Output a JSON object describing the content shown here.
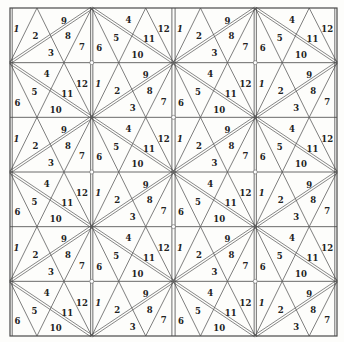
{
  "diagram": {
    "title": "",
    "grid": {
      "columns": 4,
      "rows": 6,
      "frame": {
        "x": 10,
        "y": 8,
        "width": 327,
        "height": 328
      }
    },
    "colors": {
      "background": "#fdfdfb",
      "line": "#555555",
      "text": "#222222"
    },
    "cell_types": {
      "A": {
        "description": "diagonal from bottom-left to top-right",
        "labels": [
          {
            "text": "1",
            "rx": 0.08,
            "ry": 0.4
          },
          {
            "text": "2",
            "rx": 0.31,
            "ry": 0.53
          },
          {
            "text": "3",
            "rx": 0.5,
            "ry": 0.84
          },
          {
            "text": "9",
            "rx": 0.66,
            "ry": 0.24
          },
          {
            "text": "8",
            "rx": 0.71,
            "ry": 0.53
          },
          {
            "text": "7",
            "rx": 0.88,
            "ry": 0.72
          }
        ]
      },
      "B": {
        "description": "diagonal from top-left to bottom-right",
        "labels": [
          {
            "text": "4",
            "rx": 0.45,
            "ry": 0.22
          },
          {
            "text": "5",
            "rx": 0.3,
            "ry": 0.55
          },
          {
            "text": "6",
            "rx": 0.09,
            "ry": 0.74
          },
          {
            "text": "12",
            "rx": 0.88,
            "ry": 0.4
          },
          {
            "text": "11",
            "rx": 0.7,
            "ry": 0.58
          },
          {
            "text": "10",
            "rx": 0.56,
            "ry": 0.87
          }
        ]
      }
    },
    "rows": [
      [
        "A",
        "B",
        "A",
        "B"
      ],
      [
        "B",
        "A",
        "B",
        "A"
      ],
      [
        "A",
        "B",
        "A",
        "B"
      ],
      [
        "B",
        "A",
        "B",
        "A"
      ],
      [
        "A",
        "B",
        "A",
        "B"
      ],
      [
        "B",
        "A",
        "B",
        "A"
      ]
    ]
  }
}
